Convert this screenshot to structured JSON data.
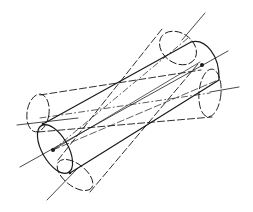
{
  "diagram": {
    "stroke_color": "#1a1a1a",
    "background": "#ffffff",
    "focal_points": [
      {
        "name": "left-focus",
        "x": 53,
        "y": 150
      },
      {
        "name": "right-focus",
        "x": 202,
        "y": 65
      }
    ],
    "cylinders": [
      {
        "name": "solid-cylinder",
        "style": "solid"
      },
      {
        "name": "dashed-cylinder-shallow",
        "style": "dashed"
      },
      {
        "name": "dashed-cylinder-steep",
        "style": "dashed"
      }
    ],
    "axes": [
      {
        "name": "solid-axis",
        "style": "solid"
      },
      {
        "name": "shallow-axis",
        "style": "dash-dot"
      },
      {
        "name": "steep-axis",
        "style": "dash-dot"
      }
    ]
  }
}
